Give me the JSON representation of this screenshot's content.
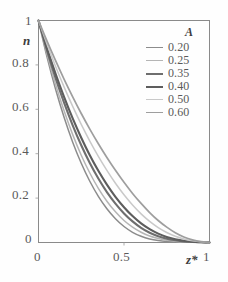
{
  "chart_data": {
    "type": "line",
    "title": "",
    "xlabel": "z*",
    "ylabel": "n",
    "xlim": [
      0,
      1
    ],
    "ylim": [
      0,
      1
    ],
    "grid": false,
    "legend_position": "top-right",
    "legend_title": "A",
    "x_ticks": [
      {
        "value": 0,
        "label": "0"
      },
      {
        "value": 0.5,
        "label": "0.5"
      },
      {
        "value": 1,
        "label": "1"
      }
    ],
    "y_ticks": [
      {
        "value": 0,
        "label": "0"
      },
      {
        "value": 0.2,
        "label": "0.2"
      },
      {
        "value": 0.4,
        "label": "0.4"
      },
      {
        "value": 0.6,
        "label": "0.6"
      },
      {
        "value": 0.8,
        "label": "0.8"
      },
      {
        "value": 1,
        "label": "1"
      }
    ],
    "x": [
      0,
      0.05,
      0.1,
      0.15,
      0.2,
      0.25,
      0.3,
      0.35,
      0.4,
      0.45,
      0.5,
      0.55,
      0.6,
      0.65,
      0.7,
      0.75,
      0.8,
      0.85,
      0.9,
      0.95,
      1
    ],
    "series": [
      {
        "name": "0.20",
        "color": "#8c8c8c",
        "width": 1.5,
        "values": [
          1.0,
          0.835,
          0.69,
          0.563,
          0.452,
          0.357,
          0.276,
          0.208,
          0.152,
          0.107,
          0.072,
          0.046,
          0.028,
          0.016,
          0.009,
          0.005,
          0.003,
          0.002,
          0.001,
          0.0004,
          0.0
        ]
      },
      {
        "name": "0.25",
        "color": "#b5b5b5",
        "width": 1.5,
        "values": [
          1.0,
          0.848,
          0.712,
          0.592,
          0.486,
          0.393,
          0.313,
          0.244,
          0.186,
          0.138,
          0.099,
          0.069,
          0.046,
          0.029,
          0.018,
          0.01,
          0.006,
          0.003,
          0.002,
          0.0008,
          0.0
        ]
      },
      {
        "name": "0.35",
        "color": "#6e6e6e",
        "width": 2.1,
        "values": [
          1.0,
          0.864,
          0.74,
          0.629,
          0.528,
          0.438,
          0.358,
          0.288,
          0.227,
          0.175,
          0.131,
          0.095,
          0.066,
          0.044,
          0.028,
          0.017,
          0.01,
          0.005,
          0.003,
          0.001,
          0.0
        ]
      },
      {
        "name": "0.40",
        "color": "#5d5d5d",
        "width": 2.1,
        "values": [
          1.0,
          0.875,
          0.76,
          0.655,
          0.559,
          0.472,
          0.393,
          0.323,
          0.261,
          0.206,
          0.159,
          0.119,
          0.086,
          0.06,
          0.04,
          0.025,
          0.015,
          0.008,
          0.004,
          0.002,
          0.0
        ]
      },
      {
        "name": "0.50",
        "color": "#c9c9c9",
        "width": 1.5,
        "values": [
          1.0,
          0.893,
          0.793,
          0.7,
          0.613,
          0.532,
          0.457,
          0.388,
          0.325,
          0.267,
          0.215,
          0.169,
          0.129,
          0.095,
          0.067,
          0.045,
          0.028,
          0.016,
          0.008,
          0.003,
          0.0
        ]
      },
      {
        "name": "0.60",
        "color": "#9e9e9e",
        "width": 1.7,
        "values": [
          1.0,
          0.907,
          0.819,
          0.735,
          0.656,
          0.581,
          0.511,
          0.445,
          0.383,
          0.325,
          0.271,
          0.221,
          0.176,
          0.135,
          0.099,
          0.069,
          0.044,
          0.025,
          0.012,
          0.004,
          0.0
        ]
      }
    ]
  },
  "axes": {
    "y_label": "n",
    "x_label": "z*"
  }
}
